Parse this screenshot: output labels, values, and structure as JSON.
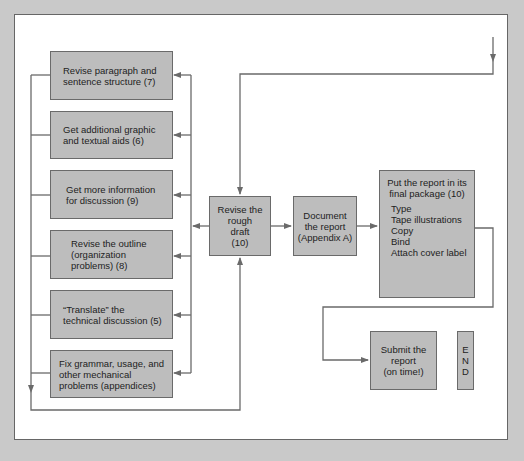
{
  "diagram": {
    "left_tasks": [
      {
        "label": "Revise paragraph and sentence structure (7)",
        "lines": [
          "Revise paragraph and",
          "sentence structure (7)"
        ]
      },
      {
        "label": "Get additional graphic and textual aids (6)",
        "lines": [
          "Get additional graphic",
          "and textual aids (6)"
        ]
      },
      {
        "label": "Get more information for discussion (9)",
        "lines": [
          "Get more information",
          "for discussion (9)"
        ]
      },
      {
        "label": "Revise the outline (organization problems) (8)",
        "lines": [
          "Revise the outline",
          "(organization",
          "problems) (8)"
        ]
      },
      {
        "label": "“Translate” the technical discussion (5)",
        "lines": [
          "“Translate” the",
          "technical discussion (5)"
        ]
      },
      {
        "label": "Fix grammar, usage, and other mechanical problems (appendices)",
        "lines": [
          "Fix grammar, usage, and",
          "other mechanical",
          "problems (appendices)"
        ]
      }
    ],
    "rough_draft": {
      "lines": [
        "Revise the",
        "rough",
        "draft",
        "(10)"
      ]
    },
    "document": {
      "lines": [
        "Document",
        "the report",
        "(Appendix A)"
      ]
    },
    "final_package": {
      "title_lines": [
        "Put the report in its",
        "final package (10)"
      ],
      "steps": [
        "Type",
        "Tape illustrations",
        "Copy",
        "Bind",
        "Attach cover label"
      ]
    },
    "submit": {
      "lines": [
        "Submit the",
        "report",
        "(on time!)"
      ]
    },
    "end": {
      "letters": [
        "E",
        "N",
        "D"
      ]
    }
  },
  "colors": {
    "background": "#c9c9c9",
    "panel": "#ffffff",
    "box_fill": "#bdbdbd",
    "line": "#6a6a6a"
  }
}
